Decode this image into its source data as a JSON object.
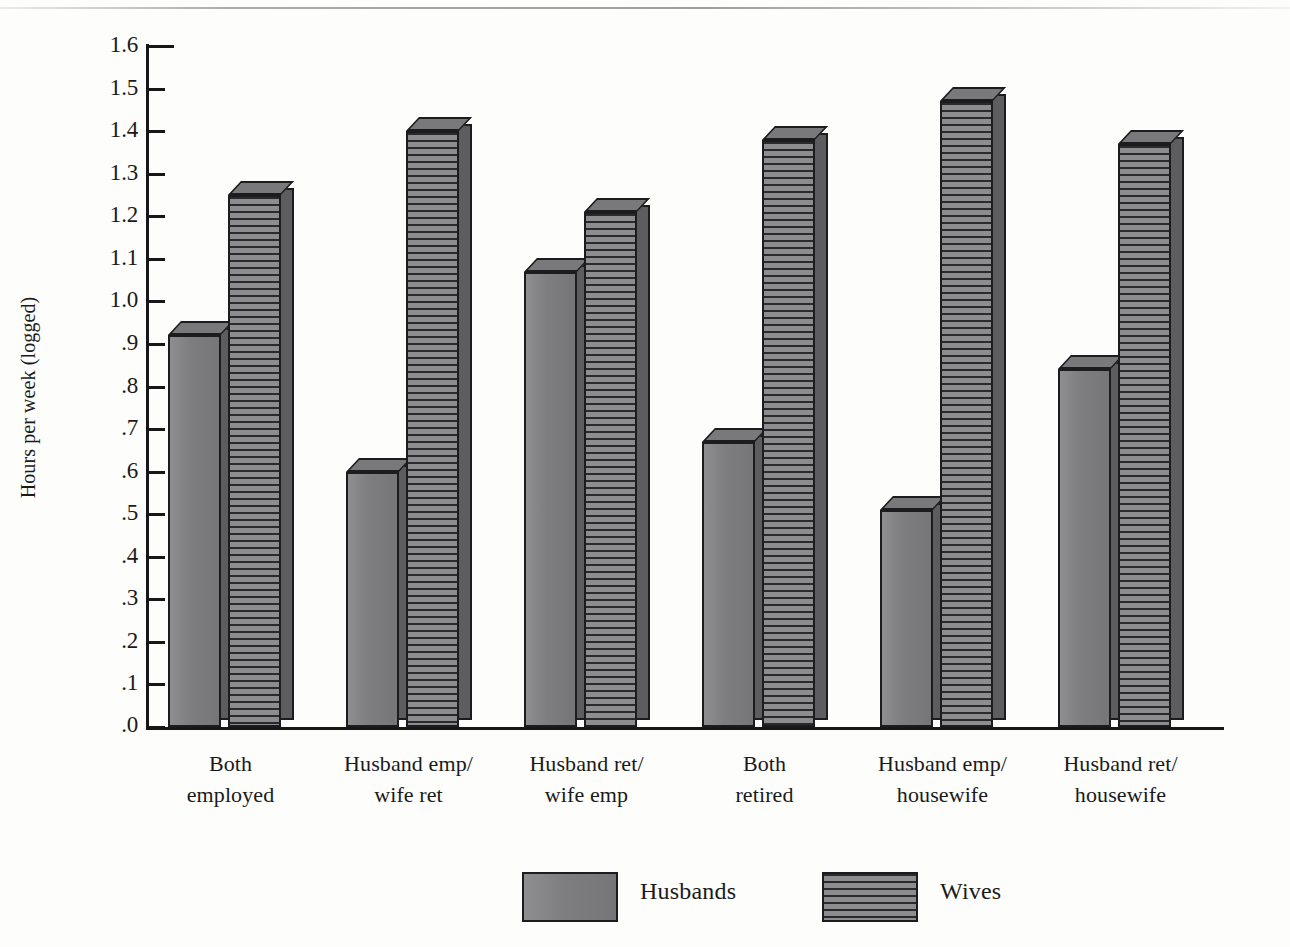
{
  "chart_data": {
    "type": "bar",
    "title": "",
    "xlabel": "",
    "ylabel": "Hours per week (logged)",
    "ylim": [
      0.0,
      1.6
    ],
    "grid": false,
    "legend_position": "bottom-center",
    "categories": [
      "Both employed",
      "Husband emp/ wife ret",
      "Husband ret/ wife emp",
      "Both retired",
      "Husband emp/ housewife",
      "Husband ret/ housewife"
    ],
    "category_lines": [
      {
        "l1": "Both",
        "l2": "employed"
      },
      {
        "l1": "Husband emp/",
        "l2": "wife ret"
      },
      {
        "l1": "Husband ret/",
        "l2": "wife emp"
      },
      {
        "l1": "Both",
        "l2": "retired"
      },
      {
        "l1": "Husband emp/",
        "l2": "housewife"
      },
      {
        "l1": "Husband ret/",
        "l2": "housewife"
      }
    ],
    "series": [
      {
        "name": "Husbands",
        "pattern": "solid",
        "values": [
          0.92,
          0.6,
          1.07,
          0.67,
          0.51,
          0.84
        ]
      },
      {
        "name": "Wives",
        "pattern": "horizontal-stripes",
        "values": [
          1.25,
          1.4,
          1.21,
          1.38,
          1.47,
          1.37
        ]
      }
    ],
    "ytick_labels": [
      "1.6",
      "1.5",
      "1.4",
      "1.3",
      "1.2",
      "1.1",
      "1.0",
      ".9",
      ".8",
      ".7",
      ".6",
      ".5",
      ".4",
      ".3",
      ".2",
      ".1",
      ".0"
    ],
    "ytick_values": [
      1.6,
      1.5,
      1.4,
      1.3,
      1.2,
      1.1,
      1.0,
      0.9,
      0.8,
      0.7,
      0.6,
      0.5,
      0.4,
      0.3,
      0.2,
      0.1,
      0.0
    ]
  },
  "legend": {
    "items": [
      {
        "label": "Husbands",
        "pattern": "solid"
      },
      {
        "label": "Wives",
        "pattern": "horizontal-stripes"
      }
    ]
  },
  "colors": {
    "ink": "#17171a",
    "bar_fill": "#7e7e80",
    "bar_side": "#5d5d5f",
    "bar_top": "#79797b",
    "stripe_dark": "#2a2a2c",
    "background": "#fdfdfb"
  }
}
